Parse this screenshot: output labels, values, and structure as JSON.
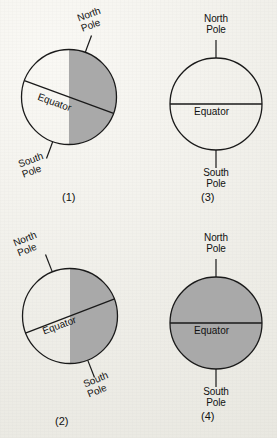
{
  "figure": {
    "background_color": "#f2f1ec",
    "ink_color": "#1a1a1a",
    "shade_color": "#a9a9a9"
  },
  "labels": {
    "north_pole_line1": "North",
    "north_pole_line2": "Pole",
    "south_pole_line1": "South",
    "south_pole_line2": "Pole",
    "equator": "Equator"
  },
  "diagrams": [
    {
      "caption": "(1)",
      "tilt_deg": -20,
      "axis": "tilted-right",
      "equator_orientation": "tilted",
      "shading": "right-half-vertical",
      "north_label_rotation": -20,
      "south_label_rotation": -20,
      "equator_label_rotation": 20
    },
    {
      "caption": "(3)",
      "tilt_deg": 0,
      "axis": "vertical",
      "equator_orientation": "horizontal",
      "shading": "none",
      "north_label_rotation": 0,
      "south_label_rotation": 0,
      "equator_label_rotation": 0
    },
    {
      "caption": "(2)",
      "tilt_deg": 20,
      "axis": "tilted-left",
      "equator_orientation": "tilted",
      "shading": "right-half-vertical",
      "north_label_rotation": -22,
      "south_label_rotation": -22,
      "equator_label_rotation": -20
    },
    {
      "caption": "(4)",
      "tilt_deg": 0,
      "axis": "vertical",
      "equator_orientation": "horizontal",
      "shading": "full",
      "north_label_rotation": 0,
      "south_label_rotation": 0,
      "equator_label_rotation": 0
    }
  ]
}
